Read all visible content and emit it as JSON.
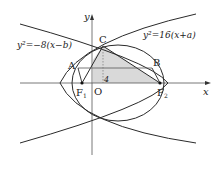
{
  "diagram": {
    "axes": {
      "x_label": "x",
      "y_label": "y",
      "origin_label": "O"
    },
    "points": {
      "A": "A",
      "B": "B",
      "C": "C",
      "F1": "F",
      "F1_sub": "1",
      "F2": "F",
      "F2_sub": "2"
    },
    "tick_label": "4",
    "equations": {
      "left_parabola": "y²=−8(x−b)",
      "right_parabola": "y²=16(x+a)"
    },
    "colors": {
      "line": "#2a2a2a",
      "shade": "#d9d9d9",
      "axis": "#555555"
    }
  }
}
